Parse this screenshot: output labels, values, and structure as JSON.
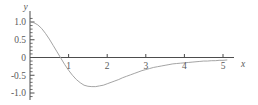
{
  "chart_data": {
    "type": "line",
    "title": "",
    "subtitle": "",
    "xlabel": "x",
    "ylabel": "y",
    "xlim": [
      -0.15,
      5.55
    ],
    "ylim": [
      -1.12,
      1.12
    ],
    "grid": false,
    "legend": null,
    "x_ticks": [
      1,
      2,
      3,
      4,
      5
    ],
    "x_tick_labels": [
      "1",
      "2",
      "3",
      "4",
      "5"
    ],
    "y_ticks": [
      1.0,
      0.5,
      0,
      -0.5,
      -1.0
    ],
    "y_tick_labels": [
      "1.0",
      "0.5",
      "0",
      "-0.5",
      "-1.0"
    ],
    "y_minor_tick_step": 0.1,
    "line_color": "#9a9a9a",
    "axis_color": "#4d4d4d",
    "text_color": "#5a5a5a",
    "background": "#ffffff",
    "series": [
      {
        "name": "curve",
        "x": [
          0.0,
          0.1,
          0.2,
          0.3,
          0.4,
          0.5,
          0.6,
          0.7,
          0.8,
          0.9,
          1.0,
          1.1,
          1.2,
          1.3,
          1.4,
          1.5,
          1.6,
          1.7,
          1.8,
          1.9,
          2.0,
          2.1,
          2.2,
          2.3,
          2.4,
          2.5,
          2.6,
          2.7,
          2.8,
          2.9,
          3.0,
          3.1,
          3.2,
          3.3,
          3.4,
          3.5,
          3.6,
          3.7,
          3.8,
          3.9,
          4.0,
          4.1,
          4.2,
          4.3,
          4.4,
          4.5,
          4.6,
          4.7,
          4.8,
          4.9,
          5.0,
          5.1
        ],
        "y": [
          1.0,
          0.98,
          0.92,
          0.82,
          0.68,
          0.52,
          0.34,
          0.16,
          -0.02,
          -0.2,
          -0.36,
          -0.5,
          -0.62,
          -0.71,
          -0.78,
          -0.81,
          -0.82,
          -0.82,
          -0.8,
          -0.78,
          -0.74,
          -0.7,
          -0.66,
          -0.62,
          -0.57,
          -0.53,
          -0.49,
          -0.45,
          -0.41,
          -0.37,
          -0.34,
          -0.31,
          -0.28,
          -0.26,
          -0.24,
          -0.22,
          -0.2,
          -0.18,
          -0.17,
          -0.16,
          -0.15,
          -0.14,
          -0.13,
          -0.12,
          -0.11,
          -0.1,
          -0.1,
          -0.09,
          -0.09,
          -0.08,
          -0.08,
          -0.07
        ]
      }
    ]
  },
  "axes": {
    "y_axis_name": "y-axis",
    "x_axis_name": "x-axis"
  }
}
